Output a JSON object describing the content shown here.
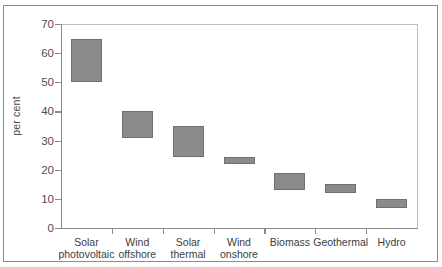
{
  "chart_data": {
    "type": "bar",
    "bar_style": "floating-range",
    "title": "",
    "subtitle": "",
    "xlabel": "",
    "ylabel": "per cent",
    "ylim": [
      0,
      70
    ],
    "ytick_step": 10,
    "yticks": [
      0,
      10,
      20,
      30,
      40,
      50,
      60,
      70
    ],
    "ytick_labels": [
      "0",
      "10",
      "20",
      "30",
      "40",
      "50",
      "60",
      "70"
    ],
    "grid": false,
    "legend": null,
    "categories": [
      "Solar photovoltaic",
      "Wind offshore",
      "Solar thermal",
      "Wind onshore",
      "Biomass",
      "Geothermal",
      "Hydro"
    ],
    "category_lines": [
      [
        "Solar",
        "photovoltaic"
      ],
      [
        "Wind",
        "offshore"
      ],
      [
        "Solar",
        "thermal"
      ],
      [
        "Wind",
        "onshore"
      ],
      [
        "Biomass",
        ""
      ],
      [
        "Geothermal",
        ""
      ],
      [
        "Hydro",
        ""
      ]
    ],
    "series": [
      {
        "name": "Range",
        "low": [
          50,
          31,
          24.5,
          22,
          13,
          12,
          7
        ],
        "high": [
          65,
          40,
          35,
          24.5,
          19,
          15,
          10
        ]
      }
    ],
    "bar_color": "#8b8b8b",
    "bar_edge_color": "#6f6f6f",
    "axis_color": "#8a8a8a",
    "text_color": "#3d3d3d"
  }
}
